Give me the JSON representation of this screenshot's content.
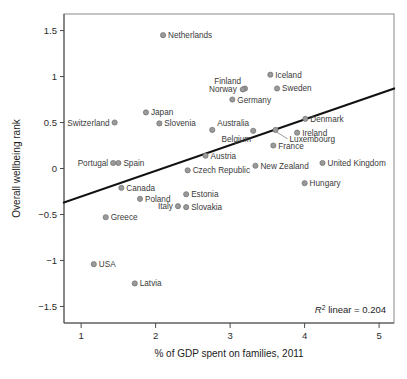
{
  "chart_data": {
    "type": "scatter",
    "title": "",
    "xlabel": "% of GDP spent on families, 2011",
    "ylabel": "Overall wellbeing rank",
    "xlim": [
      0.77,
      5.2
    ],
    "ylim": [
      -1.68,
      1.68
    ],
    "xticks": [
      1,
      2,
      3,
      4,
      5
    ],
    "xticklabels": [
      "1",
      "2",
      "3",
      "4",
      "5"
    ],
    "yticks": [
      1.5,
      1,
      0.5,
      0,
      -0.5,
      -1,
      -1.5
    ],
    "yticklabels": [
      "1.5",
      "1",
      "0.5",
      "0",
      "−0.5",
      "−1",
      "−1.5"
    ],
    "grid": false,
    "legend": null,
    "annotation": "R² linear = 0.204",
    "annotation_prefix": "R",
    "annotation_sup": "2",
    "annotation_rest": " linear = 0.204",
    "r_squared": 0.204,
    "marker_color": "#9a9a9a",
    "marker_edge_color": "#6e6e6e",
    "fitline_color": "#111111",
    "fitline": {
      "x_start": 0.77,
      "y_start": -0.37,
      "x_end": 5.2,
      "y_end": 0.87
    },
    "points": [
      {
        "label": "Netherlands",
        "x": 2.1,
        "y": 1.45,
        "label_pos": "right"
      },
      {
        "label": "Iceland",
        "x": 3.54,
        "y": 1.02,
        "label_pos": "right"
      },
      {
        "label": "Finland",
        "x": 3.2,
        "y": 0.87,
        "label_pos": "above"
      },
      {
        "label": "Norway",
        "x": 3.17,
        "y": 0.86,
        "label_pos": "left"
      },
      {
        "label": "Sweden",
        "x": 3.63,
        "y": 0.87,
        "label_pos": "right"
      },
      {
        "label": "Germany",
        "x": 3.03,
        "y": 0.75,
        "label_pos": "right"
      },
      {
        "label": "Japan",
        "x": 1.87,
        "y": 0.61,
        "label_pos": "right"
      },
      {
        "label": "Denmark",
        "x": 4.01,
        "y": 0.54,
        "label_pos": "right"
      },
      {
        "label": "Switzerland",
        "x": 1.45,
        "y": 0.5,
        "label_pos": "left"
      },
      {
        "label": "Slovenia",
        "x": 2.05,
        "y": 0.49,
        "label_pos": "right"
      },
      {
        "label": "Australia",
        "x": 2.76,
        "y": 0.42,
        "label_pos": "above"
      },
      {
        "label": "Belgium",
        "x": 3.31,
        "y": 0.41,
        "label_pos": "below"
      },
      {
        "label": "Luxembourg",
        "x": 3.61,
        "y": 0.42,
        "label_pos": "leader"
      },
      {
        "label": "Ireland",
        "x": 3.9,
        "y": 0.39,
        "label_pos": "right"
      },
      {
        "label": "France",
        "x": 3.58,
        "y": 0.25,
        "label_pos": "right"
      },
      {
        "label": "Austria",
        "x": 2.67,
        "y": 0.14,
        "label_pos": "right"
      },
      {
        "label": "Portugal",
        "x": 1.43,
        "y": 0.06,
        "label_pos": "left"
      },
      {
        "label": "Spain",
        "x": 1.5,
        "y": 0.06,
        "label_pos": "right"
      },
      {
        "label": "United Kingdom",
        "x": 4.24,
        "y": 0.06,
        "label_pos": "right"
      },
      {
        "label": "New Zealand",
        "x": 3.34,
        "y": 0.03,
        "label_pos": "right"
      },
      {
        "label": "Czech Republic",
        "x": 2.43,
        "y": -0.02,
        "label_pos": "right"
      },
      {
        "label": "Hungary",
        "x": 4.0,
        "y": -0.16,
        "label_pos": "right"
      },
      {
        "label": "Canada",
        "x": 1.54,
        "y": -0.21,
        "label_pos": "right"
      },
      {
        "label": "Estonia",
        "x": 2.41,
        "y": -0.28,
        "label_pos": "right"
      },
      {
        "label": "Poland",
        "x": 1.79,
        "y": -0.33,
        "label_pos": "right"
      },
      {
        "label": "Italy",
        "x": 2.3,
        "y": -0.41,
        "label_pos": "left"
      },
      {
        "label": "Slovakia",
        "x": 2.41,
        "y": -0.42,
        "label_pos": "right"
      },
      {
        "label": "Greece",
        "x": 1.33,
        "y": -0.53,
        "label_pos": "right"
      },
      {
        "label": "USA",
        "x": 1.17,
        "y": -1.04,
        "label_pos": "right"
      },
      {
        "label": "Latvia",
        "x": 1.72,
        "y": -1.25,
        "label_pos": "right"
      }
    ]
  }
}
